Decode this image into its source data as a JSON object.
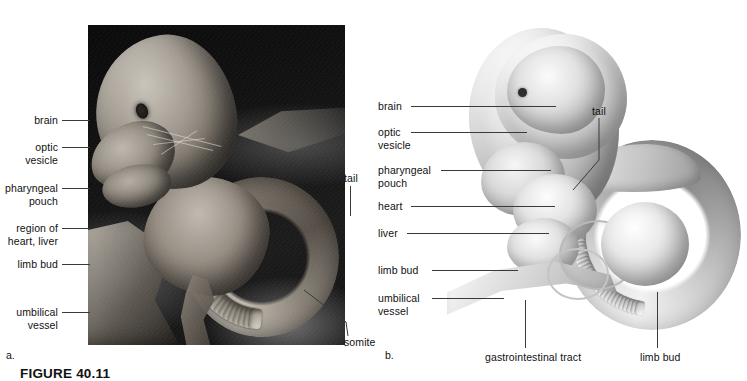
{
  "figure": {
    "caption": "FIGURE 40.11",
    "panels": [
      {
        "letter": "a.",
        "kind": "scanning-electron-micrograph"
      },
      {
        "letter": "b.",
        "kind": "illustration"
      }
    ]
  },
  "panel_a": {
    "letter": "a.",
    "labels_left": [
      {
        "id": "brain",
        "text": "brain"
      },
      {
        "id": "optic",
        "text": "optic\nvesicle"
      },
      {
        "id": "pharyngeal",
        "text": "pharyngeal\npouch"
      },
      {
        "id": "heart-liver",
        "text": "region of\nheart, liver"
      },
      {
        "id": "limb-bud",
        "text": "limb bud"
      },
      {
        "id": "umbilical",
        "text": "umbilical\nvessel"
      }
    ],
    "labels_right": [
      {
        "id": "tail",
        "text": "tail"
      },
      {
        "id": "somite",
        "text": "somite"
      }
    ]
  },
  "panel_b": {
    "letter": "b.",
    "labels_left": [
      {
        "id": "brain",
        "text": "brain"
      },
      {
        "id": "optic",
        "text": "optic\nvesicle"
      },
      {
        "id": "pharyngeal",
        "text": "pharyngeal\npouch"
      },
      {
        "id": "heart",
        "text": "heart"
      },
      {
        "id": "liver",
        "text": "liver"
      },
      {
        "id": "limb-bud",
        "text": "limb bud"
      },
      {
        "id": "umbilical",
        "text": "umbilical\nvessel"
      }
    ],
    "labels_right": [
      {
        "id": "tail",
        "text": "tail"
      }
    ],
    "labels_bottom": [
      {
        "id": "gi-tract",
        "text": "gastrointestinal tract"
      },
      {
        "id": "limb-bud-bottom",
        "text": "limb bud"
      }
    ]
  },
  "colors": {
    "background": "#ffffff",
    "text": "#111111",
    "leader_line": "#3a3a3a",
    "micrograph_backdrop": "#0b0b0b"
  }
}
